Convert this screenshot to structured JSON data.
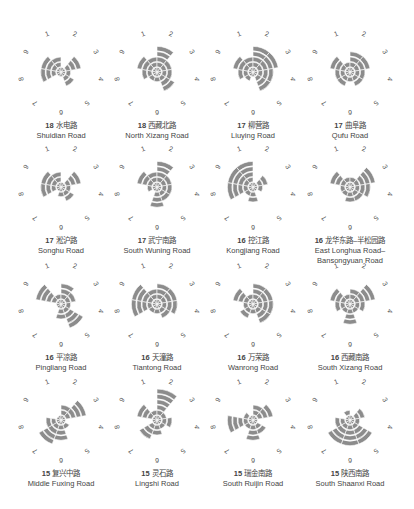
{
  "chart_data": {
    "type": "polar-area",
    "title": "",
    "directions": [
      "1",
      "2",
      "3",
      "4",
      "5",
      "6",
      "7",
      "8",
      "9"
    ],
    "direction_angles_deg": [
      340,
      20,
      60,
      100,
      140,
      180,
      220,
      260,
      300
    ],
    "ring_unit": "bands",
    "sector_color": "#8c8c8c",
    "grid_color": "#ffffff",
    "charts": [
      {
        "count": "18",
        "name_cn": "水电路",
        "name_en": "Shuidian Road",
        "values": [
          3,
          1,
          4,
          2,
          3,
          1,
          1,
          4,
          4
        ]
      },
      {
        "count": "18",
        "name_cn": "西藏北路",
        "name_en": "North Xizang Road",
        "values": [
          3,
          5,
          3,
          3,
          4,
          2,
          2,
          3,
          4
        ]
      },
      {
        "count": "17",
        "name_cn": "柳营路",
        "name_en": "Liuying Road",
        "values": [
          3,
          5,
          5,
          4,
          4,
          1,
          2,
          3,
          4
        ]
      },
      {
        "count": "17",
        "name_cn": "曲阜路",
        "name_en": "Qufu Road",
        "values": [
          2,
          4,
          4,
          3,
          3,
          2,
          3,
          3,
          4
        ]
      },
      {
        "count": "17",
        "name_cn": "淞沪路",
        "name_en": "Songhu Road",
        "values": [
          3,
          1,
          4,
          2,
          3,
          2,
          1,
          4,
          4
        ]
      },
      {
        "count": "17",
        "name_cn": "武宁南路",
        "name_en": "South Wuning Road",
        "values": [
          3,
          5,
          3,
          3,
          3,
          4,
          1,
          2,
          4
        ]
      },
      {
        "count": "16",
        "name_cn": "控江路",
        "name_en": "Kongjiang Road",
        "values": [
          5,
          1,
          3,
          2,
          1,
          3,
          2,
          5,
          5
        ]
      },
      {
        "count": "16",
        "name_cn": "龙华东路–半松园路",
        "name_en": "East Longhua Road–",
        "name_en2": "Bansongyuan Road",
        "values": [
          2,
          2,
          5,
          4,
          3,
          3,
          2,
          2,
          4
        ]
      },
      {
        "count": "16",
        "name_cn": "平凉路",
        "name_en": "Pingliang Road",
        "values": [
          2,
          4,
          3,
          2,
          5,
          3,
          1,
          1,
          5
        ]
      },
      {
        "count": "16",
        "name_cn": "天潼路",
        "name_en": "Tiantong Road",
        "values": [
          3,
          4,
          4,
          4,
          3,
          2,
          2,
          5,
          5
        ]
      },
      {
        "count": "16",
        "name_cn": "万荣路",
        "name_en": "Wanrong Road",
        "values": [
          2,
          4,
          4,
          4,
          4,
          2,
          3,
          2,
          4
        ]
      },
      {
        "count": "16",
        "name_cn": "西藏南路",
        "name_en": "South Xizang Road",
        "values": [
          2,
          3,
          5,
          3,
          2,
          4,
          2,
          3,
          4
        ]
      },
      {
        "count": "15",
        "name_cn": "复兴中路",
        "name_en": "Middle Fuxing Road",
        "values": [
          1,
          3,
          5,
          1,
          2,
          4,
          5,
          3,
          1
        ]
      },
      {
        "count": "15",
        "name_cn": "灵石路",
        "name_en": "Lingshi Road",
        "values": [
          2,
          6,
          2,
          3,
          2,
          3,
          4,
          1,
          4
        ]
      },
      {
        "count": "15",
        "name_cn": "瑞金南路",
        "name_en": "South Ruijin Road",
        "values": [
          1,
          3,
          4,
          1,
          3,
          4,
          2,
          5,
          2
        ]
      },
      {
        "count": "15",
        "name_cn": "陕西南路",
        "name_en": "South Shaanxi Road",
        "values": [
          2,
          1,
          3,
          2,
          5,
          5,
          5,
          3,
          1
        ]
      }
    ]
  }
}
